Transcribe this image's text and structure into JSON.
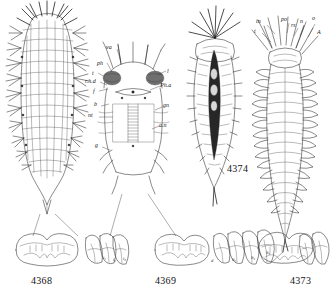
{
  "plate": {
    "title": "Zoological plate — polychaete anatomy",
    "background_color": "#ffffff",
    "ink_color": "#2b2b2b",
    "figures": [
      {
        "number": "4368",
        "caption_position": "bottom-left",
        "description": "Dorsal view of entire bristle-covered worm body with lateral parapodia and terminal tail",
        "labels": []
      },
      {
        "number": "4369",
        "caption_position": "bottom-center",
        "description": "Dissected anterior end showing internal organs, pharynx, ganglia and nerve cord",
        "labels": [
          {
            "id": "va",
            "text": "va",
            "x": 108,
            "y": 47
          },
          {
            "id": "ph",
            "text": "ph",
            "x": 100,
            "y": 64
          },
          {
            "id": "t",
            "text": "t",
            "x": 93,
            "y": 74
          },
          {
            "id": "rhd",
            "text": "r.h.d",
            "x": 89,
            "y": 82
          },
          {
            "id": "f",
            "text": "f",
            "x": 95,
            "y": 92
          },
          {
            "id": "b",
            "text": "b",
            "x": 96,
            "y": 105
          },
          {
            "id": "nt",
            "text": "nt",
            "x": 91,
            "y": 116
          },
          {
            "id": "g",
            "text": "g",
            "x": 97,
            "y": 146
          },
          {
            "id": "l",
            "text": "l",
            "x": 166,
            "y": 72
          },
          {
            "id": "pha",
            "text": "Ph.a",
            "x": 161,
            "y": 86
          },
          {
            "id": "gn",
            "text": "gn",
            "x": 163,
            "y": 106
          },
          {
            "id": "an",
            "text": "a.n",
            "x": 160,
            "y": 126
          }
        ]
      },
      {
        "number": "4374",
        "caption_position": "inline-right",
        "description": "Worm with radiating head tentacles and dark elongated median organ tapering to a point",
        "labels": []
      },
      {
        "number": "4373",
        "caption_position": "bottom-right",
        "description": "Segmented worm with crown of anterior appendages and paired lateral parapodia",
        "labels": [
          {
            "id": "tn",
            "text": "tn",
            "x": 258,
            "y": 22
          },
          {
            "id": "po",
            "text": "po",
            "x": 280,
            "y": 20
          },
          {
            "id": "rs",
            "text": "rs",
            "x": 292,
            "y": 26
          },
          {
            "id": "n",
            "text": "n",
            "x": 299,
            "y": 22
          },
          {
            "id": "o",
            "text": "o",
            "x": 313,
            "y": 19
          },
          {
            "id": "t2",
            "text": "t",
            "x": 256,
            "y": 32
          },
          {
            "id": "A",
            "text": "A",
            "x": 317,
            "y": 33
          }
        ]
      },
      {
        "number": "detail-4368",
        "description": "Detail of mandibles and three maxillary plates of figure 4368",
        "labels": [
          {
            "id": "i1",
            "text": "i₁",
            "x": 105,
            "y": 258
          },
          {
            "id": "i2",
            "text": "i₂",
            "x": 114,
            "y": 260
          },
          {
            "id": "i3",
            "text": "i₃",
            "x": 123,
            "y": 259
          }
        ]
      },
      {
        "number": "detail-4369",
        "description": "Detail of mandibles and maxillae of figure 4369",
        "labels": [
          {
            "id": "d",
            "text": "d",
            "x": 212,
            "y": 261
          },
          {
            "id": "lt1",
            "text": "lt₁",
            "x": 234,
            "y": 260
          },
          {
            "id": "lt2",
            "text": "lt₂",
            "x": 253,
            "y": 258
          },
          {
            "id": "lt3",
            "text": "lt₃",
            "x": 268,
            "y": 253
          }
        ]
      },
      {
        "number": "detail-4373",
        "description": "Detail of mandibles and maxillae of figure 4373",
        "labels": []
      }
    ],
    "figure_numbers": {
      "fig_4368": "4368",
      "fig_4369": "4369",
      "fig_4374": "4374",
      "fig_4373": "4373"
    }
  }
}
